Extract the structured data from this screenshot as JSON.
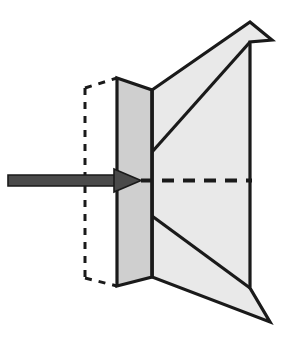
{
  "figure": {
    "canvas": {
      "width": 286,
      "height": 353,
      "background": "#ffffff"
    },
    "colors": {
      "outline": "#1a1a1a",
      "front_panel_fill": "#cfcfcf",
      "back_panel_fill": "#e9e9e9",
      "arrow_fill": "#4a4a4a",
      "arrow_outline": "#1a1a1a",
      "dashed_hidden_edge": "#1a1a1a",
      "dashed_centerline": "#1a1a1a",
      "background": "#ffffff"
    },
    "stroke_widths": {
      "outline": 3.2,
      "inner_fold": 3.2,
      "diagonal": 3.2,
      "hidden_dash": 3.0,
      "centerline_dash": 4.0
    },
    "dash_patterns": {
      "hidden_edge": "7,7",
      "centerline": "12,9"
    },
    "shapes": {
      "back_panel_points": "152,90 250,22 272,40 250,42 250,288 270,322 152,277",
      "front_panel_points": "117,78 152,90 152,277 117,286",
      "upper_diagonal": "152,152 250,42",
      "lower_diagonal": "152,216 250,288",
      "fold_line": "152,90 152,277",
      "back_top_edge": "152,90 250,22",
      "back_apex_top": "250,22 272,40 250,42",
      "back_right_edge": "250,42 250,288",
      "back_apex_bottom": "250,288 270,322 152,277",
      "hidden_vertical": "85,88 85,278",
      "hidden_top_diagonal": "85,88 117,78",
      "hidden_bottom_diagonal": "85,278 117,286"
    },
    "arrow": {
      "shaft_points": "8,175 116,175 116,186 8,186",
      "head_points": "114,169 141,180.5 114,192",
      "centerline_start_x": 141,
      "centerline_end_x": 252,
      "centerline_y": 180.5
    }
  }
}
